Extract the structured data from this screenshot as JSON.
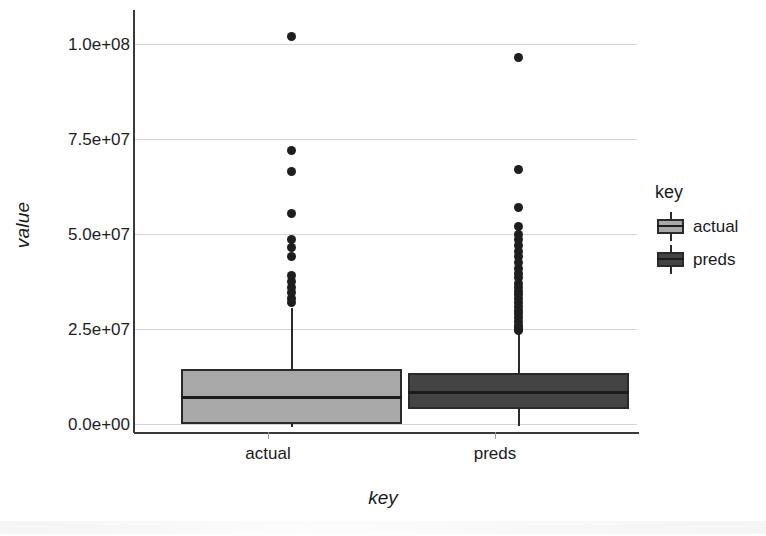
{
  "chart_data": {
    "type": "box",
    "title": "",
    "xlabel": "key",
    "ylabel": "value",
    "categories": [
      "actual",
      "preds"
    ],
    "ylim": [
      -5000000,
      105000000
    ],
    "grid": true,
    "legend_position": "right",
    "legend_title": "key",
    "yticks": [
      {
        "label": "0.0e+00",
        "value": 0
      },
      {
        "label": "2.5e+07",
        "value": 25000000
      },
      {
        "label": "5.0e+07",
        "value": 50000000
      },
      {
        "label": "7.5e+07",
        "value": 75000000
      },
      {
        "label": "1.0e+08",
        "value": 100000000
      }
    ],
    "series": [
      {
        "name": "actual",
        "color": "#a8a8a8",
        "q1": 0,
        "median": 7000000,
        "q3": 14500000,
        "whisker_low": -900000,
        "whisker_high": 30500000,
        "outliers": [
          102000000,
          72000000,
          66500000,
          55500000,
          48500000,
          46500000,
          44000000,
          39000000,
          37500000,
          36000000,
          34500000,
          33000000,
          32000000
        ]
      },
      {
        "name": "preds",
        "color": "#444444",
        "q1": 4000000,
        "median": 8200000,
        "q3": 13500000,
        "whisker_low": -500000,
        "whisker_high": 30000000,
        "outliers": [
          96500000,
          67000000,
          57000000,
          52000000,
          50000000,
          48500000,
          47000000,
          45500000,
          44000000,
          42500000,
          41000000,
          39500000,
          38500000,
          37000000,
          36000000,
          35000000,
          34000000,
          33000000,
          32000000,
          31000000,
          30000000,
          29000000,
          28000000,
          27000000,
          26000000,
          25500000,
          25000000,
          24500000
        ]
      }
    ]
  },
  "axis": {
    "y_title": "value",
    "x_title": "key",
    "ytick_labels": [
      "1.0e+08",
      "7.5e+07",
      "5.0e+07",
      "2.5e+07",
      "0.0e+00"
    ],
    "xtick_labels": [
      "actual",
      "preds"
    ]
  },
  "legend": {
    "title": "key",
    "items": [
      {
        "label": "actual",
        "color": "#a8a8a8"
      },
      {
        "label": "preds",
        "color": "#444444"
      }
    ]
  }
}
